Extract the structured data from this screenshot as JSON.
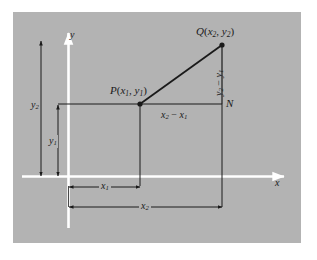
{
  "figure": {
    "type": "coordinate-geometry-diagram",
    "background_color": "#b3b3b3",
    "page_color": "#ffffff",
    "line_color": "#1a1a1a",
    "axis_color": "#ffffff",
    "axes": {
      "x_label": "x",
      "y_label": "y"
    },
    "points": [
      {
        "name": "P",
        "label_parts": {
          "letter": "P",
          "open": "(",
          "x": "x",
          "xsub": "1",
          "comma": ", ",
          "y": "y",
          "ysub": "1",
          "close": ")"
        }
      },
      {
        "name": "Q",
        "label_parts": {
          "letter": "Q",
          "open": "(",
          "x": "x",
          "xsub": "2",
          "comma": ", ",
          "y": "y",
          "ysub": "2",
          "close": ")"
        }
      },
      {
        "name": "N",
        "label_parts": {
          "letter": "N"
        }
      }
    ],
    "segment_labels": {
      "horizontal_leg": {
        "minuend": "x",
        "minuend_sub": "2",
        "op": " − ",
        "subtrahend": "x",
        "subtrahend_sub": "1"
      },
      "vertical_leg": {
        "minuend": "y",
        "minuend_sub": "2",
        "op": " − ",
        "subtrahend": "y",
        "subtrahend_sub": "1"
      }
    },
    "dimensions": [
      {
        "name": "x1",
        "letter": "x",
        "sub": "1",
        "orientation": "horizontal"
      },
      {
        "name": "x2",
        "letter": "x",
        "sub": "2",
        "orientation": "horizontal"
      },
      {
        "name": "y1",
        "letter": "y",
        "sub": "1",
        "orientation": "vertical"
      },
      {
        "name": "y2",
        "letter": "y",
        "sub": "2",
        "orientation": "vertical"
      }
    ]
  }
}
